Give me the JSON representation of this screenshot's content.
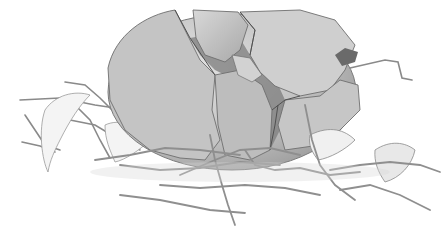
{
  "illustration": {
    "subject": "cracked-egg-in-nest",
    "style": "grayscale pencil sketch",
    "colors": {
      "background": "#ffffff",
      "shell_light": "#d6d6d6",
      "shell_mid": "#b8b8b8",
      "shell_dark": "#8f8f8f",
      "crack": "#5a5a5a",
      "twig": "#9a9a9a",
      "outline": "#6e6e6e"
    }
  }
}
